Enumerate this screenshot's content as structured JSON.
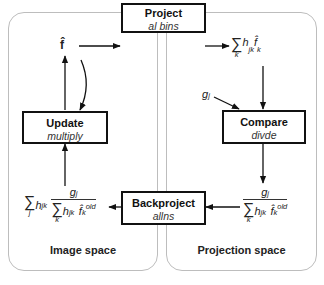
{
  "diagram": {
    "panels": {
      "left": {
        "label": "Image space"
      },
      "right": {
        "label": "Projection space"
      }
    },
    "boxes": {
      "project": {
        "title": "Project",
        "subtitle": "al bins"
      },
      "compare": {
        "title": "Compare",
        "subtitle": "divde"
      },
      "backproject": {
        "title": "Backproject",
        "subtitle": "allns"
      },
      "update": {
        "title": "Update",
        "subtitle": "multiply"
      }
    },
    "nodes": {
      "f_hat": "f̂",
      "g_j": "g",
      "g_j_sub": "j"
    },
    "formulas": {
      "forward_projection": {
        "sum": "∑",
        "sum_index": "k",
        "h": "h",
        "h_sub": "jk",
        "f": "f̂",
        "f_sub": "k"
      },
      "ratio": {
        "num": "g",
        "num_sub": "j",
        "sum": "∑",
        "sum_index": "k",
        "h": "h",
        "h_sub": "jk",
        "f": "f̂",
        "f_sub": "k",
        "f_sup": "old"
      },
      "backprojected_ratio": {
        "outer_sum": "∑",
        "outer_index": "j",
        "h": "h",
        "h_sub": "jk"
      }
    },
    "colors": {
      "panel_border": "#bdbdbd",
      "box_border": "#111111",
      "arrow": "#111111"
    }
  }
}
